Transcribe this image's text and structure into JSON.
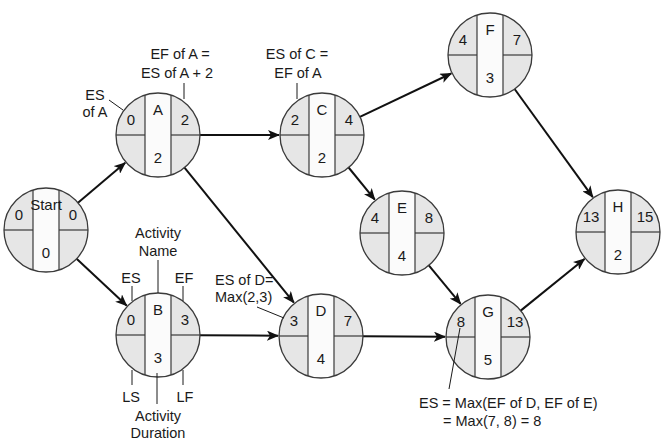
{
  "colors": {
    "quadrant_fill": "#e6e6e6",
    "center_fill": "#fbfbfb",
    "line": "#111111",
    "background": "#ffffff"
  },
  "nodes": [
    {
      "id": "start",
      "name": "Start",
      "es": "0",
      "ef": "0",
      "duration": "0",
      "cx": 46,
      "cy": 230
    },
    {
      "id": "a",
      "name": "A",
      "es": "0",
      "ef": "2",
      "duration": "2",
      "cx": 158,
      "cy": 135
    },
    {
      "id": "b",
      "name": "B",
      "es": "0",
      "ef": "3",
      "duration": "3",
      "cx": 158,
      "cy": 335
    },
    {
      "id": "c",
      "name": "C",
      "es": "2",
      "ef": "4",
      "duration": "2",
      "cx": 322,
      "cy": 135
    },
    {
      "id": "d",
      "name": "D",
      "es": "3",
      "ef": "7",
      "duration": "4",
      "cx": 321,
      "cy": 336
    },
    {
      "id": "e",
      "name": "E",
      "es": "4",
      "ef": "8",
      "duration": "4",
      "cx": 402,
      "cy": 233
    },
    {
      "id": "f",
      "name": "F",
      "es": "4",
      "ef": "7",
      "duration": "3",
      "cx": 490,
      "cy": 55
    },
    {
      "id": "g",
      "name": "G",
      "es": "8",
      "ef": "13",
      "duration": "5",
      "cx": 488,
      "cy": 337
    },
    {
      "id": "h",
      "name": "H",
      "es": "13",
      "ef": "15",
      "duration": "2",
      "cx": 618,
      "cy": 232
    }
  ],
  "edges": [
    {
      "from": "start",
      "to": "a"
    },
    {
      "from": "start",
      "to": "b"
    },
    {
      "from": "a",
      "to": "c"
    },
    {
      "from": "a",
      "to": "d"
    },
    {
      "from": "b",
      "to": "d"
    },
    {
      "from": "c",
      "to": "f"
    },
    {
      "from": "c",
      "to": "e"
    },
    {
      "from": "e",
      "to": "g"
    },
    {
      "from": "d",
      "to": "g"
    },
    {
      "from": "f",
      "to": "h"
    },
    {
      "from": "g",
      "to": "h"
    }
  ],
  "annotations": {
    "es_of_a": [
      "ES",
      "of A"
    ],
    "ef_of_a": [
      "EF of A =",
      "ES of A + 2"
    ],
    "es_of_c": [
      "ES of C =",
      "EF of A"
    ],
    "es_of_d": [
      "ES of D=",
      "Max(2,3)"
    ],
    "activity_name": [
      "Activity",
      "Name"
    ],
    "es_label": "ES",
    "ef_label": "EF",
    "ls_label": "LS",
    "lf_label": "LF",
    "activity_duration": [
      "Activity",
      "Duration"
    ],
    "es_of_g": [
      "ES = Max(EF of D, EF of E)",
      "= Max(7, 8) = 8"
    ]
  }
}
